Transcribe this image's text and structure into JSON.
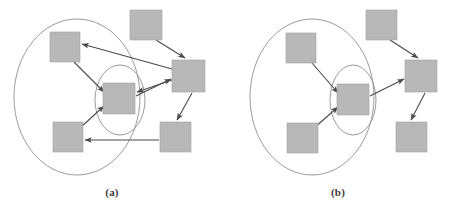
{
  "figure": {
    "kind": "two-panel-node-link-diagram",
    "width": 449,
    "height": 214,
    "background_color": "#ffffff",
    "node_fill_color": "#b8b8b8",
    "node_stroke_color": "#a0a0a0",
    "edge_color": "#4a4a4a",
    "ellipse_stroke_color": "#8f8f8f"
  },
  "panels": [
    {
      "id": "a",
      "caption": "(a)",
      "outer_ellipse": {
        "cx": 77,
        "cy": 97,
        "rx": 63,
        "ry": 78
      },
      "inner_ellipse": {
        "cx": 120,
        "cy": 100,
        "rx": 25,
        "ry": 35
      },
      "nodes": [
        {
          "id": "a-top-left",
          "label": "",
          "x": 50,
          "y": 32,
          "w": 30,
          "h": 30,
          "inside_outer": true,
          "inside_inner": false
        },
        {
          "id": "a-center",
          "label": "",
          "x": 103,
          "y": 83,
          "w": 32,
          "h": 31,
          "inside_outer": true,
          "inside_inner": true
        },
        {
          "id": "a-bottom-left",
          "label": "",
          "x": 53,
          "y": 122,
          "w": 30,
          "h": 30,
          "inside_outer": true,
          "inside_inner": false
        },
        {
          "id": "a-top-middle",
          "label": "",
          "x": 130,
          "y": 10,
          "w": 32,
          "h": 30,
          "inside_outer": false,
          "inside_inner": false
        },
        {
          "id": "a-right",
          "label": "",
          "x": 172,
          "y": 60,
          "w": 33,
          "h": 32,
          "inside_outer": false,
          "inside_inner": false
        },
        {
          "id": "a-bottom-right",
          "label": "",
          "x": 160,
          "y": 122,
          "w": 31,
          "h": 30,
          "inside_outer": false,
          "inside_inner": false
        }
      ],
      "edges": [
        {
          "from": "a-right",
          "to": "a-top-left",
          "x1": 172,
          "y1": 69,
          "x2": 82,
          "y2": 44
        },
        {
          "from": "a-right",
          "to": "a-center",
          "x1": 172,
          "y1": 80,
          "x2": 137,
          "y2": 92
        },
        {
          "from": "a-top-left",
          "to": "a-center",
          "x1": 74,
          "y1": 62,
          "x2": 104,
          "y2": 92
        },
        {
          "from": "a-bottom-left",
          "to": "a-center",
          "x1": 80,
          "y1": 128,
          "x2": 104,
          "y2": 106
        },
        {
          "from": "a-top-middle",
          "to": "a-right",
          "x1": 156,
          "y1": 40,
          "x2": 185,
          "y2": 58
        },
        {
          "from": "a-center",
          "to": "a-right",
          "x1": 136,
          "y1": 96,
          "x2": 171,
          "y2": 79
        },
        {
          "from": "a-right",
          "to": "a-bottom-right",
          "x1": 192,
          "y1": 93,
          "x2": 177,
          "y2": 120
        },
        {
          "from": "a-bottom-right",
          "to": "a-bottom-left",
          "x1": 159,
          "y1": 140,
          "x2": 85,
          "y2": 140
        }
      ]
    },
    {
      "id": "b",
      "caption": "(b)",
      "outer_ellipse": {
        "cx": 312,
        "cy": 97,
        "rx": 62,
        "ry": 78
      },
      "inner_ellipse": {
        "cx": 353,
        "cy": 100,
        "rx": 23,
        "ry": 35
      },
      "nodes": [
        {
          "id": "b-top-left",
          "label": "",
          "x": 286,
          "y": 33,
          "w": 30,
          "h": 30,
          "inside_outer": true,
          "inside_inner": false
        },
        {
          "id": "b-center",
          "label": "",
          "x": 337,
          "y": 84,
          "w": 32,
          "h": 31,
          "inside_outer": true,
          "inside_inner": true
        },
        {
          "id": "b-bottom-left",
          "label": "",
          "x": 287,
          "y": 123,
          "w": 31,
          "h": 30,
          "inside_outer": true,
          "inside_inner": false
        },
        {
          "id": "b-top-middle",
          "label": "",
          "x": 366,
          "y": 10,
          "w": 31,
          "h": 30,
          "inside_outer": false,
          "inside_inner": false
        },
        {
          "id": "b-right",
          "label": "",
          "x": 405,
          "y": 60,
          "w": 32,
          "h": 32,
          "inside_outer": false,
          "inside_inner": false
        },
        {
          "id": "b-bottom-right",
          "label": "",
          "x": 396,
          "y": 122,
          "w": 31,
          "h": 30,
          "inside_outer": false,
          "inside_inner": false
        }
      ],
      "edges": [
        {
          "from": "b-top-left",
          "to": "b-center",
          "x1": 312,
          "y1": 63,
          "x2": 338,
          "y2": 93
        },
        {
          "from": "b-bottom-left",
          "to": "b-center",
          "x1": 314,
          "y1": 128,
          "x2": 338,
          "y2": 107
        },
        {
          "from": "b-top-middle",
          "to": "b-right",
          "x1": 390,
          "y1": 40,
          "x2": 418,
          "y2": 58
        },
        {
          "from": "b-center",
          "to": "b-right",
          "x1": 370,
          "y1": 96,
          "x2": 404,
          "y2": 79
        },
        {
          "from": "b-right",
          "to": "b-bottom-right",
          "x1": 425,
          "y1": 93,
          "x2": 411,
          "y2": 120
        }
      ]
    }
  ]
}
